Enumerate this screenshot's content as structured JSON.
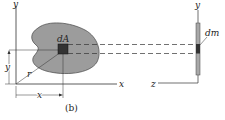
{
  "figure": {
    "caption": "(b)",
    "left_view": {
      "axis_y_label": "y",
      "axis_x_label": "x",
      "element_label": "dA",
      "radius_label": "r",
      "dim_x_label": "x",
      "dim_y_label": "y"
    },
    "right_view": {
      "axis_y_label": "y",
      "axis_z_label": "z",
      "element_label": "dm"
    },
    "colors": {
      "area_fill": "#9c9c9c",
      "element_fill": "#333333",
      "bar_fill": "#a8a8a8",
      "line": "#333333"
    }
  }
}
